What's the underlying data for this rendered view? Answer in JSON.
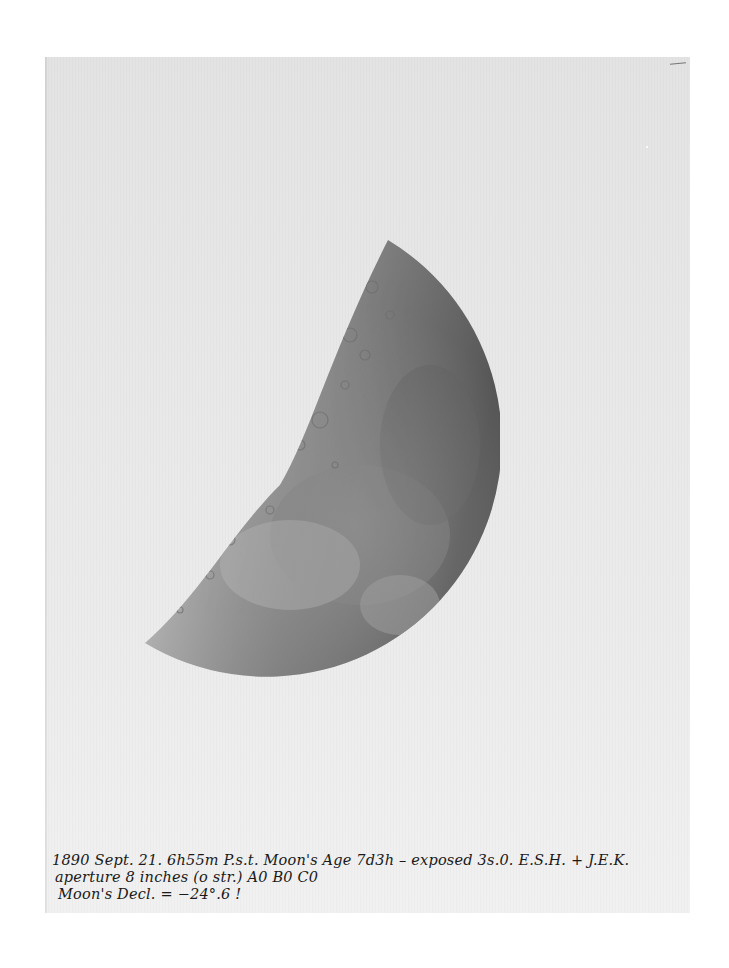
{
  "photograph": {
    "subject": "Moon (waxing, near first quarter)",
    "tone": "monochrome",
    "paper_color": "#e8e8e8",
    "moon_dark_color": "#5a5a5a",
    "moon_light_color": "#d6d6d6"
  },
  "caption": {
    "line1": "1890 Sept. 21. 6h55m P.s.t. Moon's Age 7d3h – exposed 3s.0.   E.S.H. + J.E.K.",
    "line2": "aperture 8 inches (o str.) A0 B0 C0",
    "line3": "Moon's Decl. = −24°.6 !"
  }
}
